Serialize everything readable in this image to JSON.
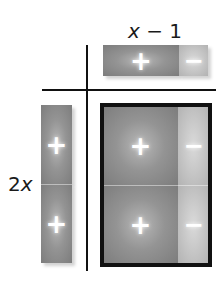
{
  "diagram": {
    "top_factor": {
      "label_var": "x",
      "label_rest": " − 1",
      "tiles": [
        {
          "type": "x",
          "sign": "+"
        },
        {
          "type": "unit",
          "sign": "−"
        }
      ]
    },
    "left_factor": {
      "label_coef": "2",
      "label_var": "x",
      "tiles": [
        {
          "type": "x",
          "sign": "+"
        },
        {
          "type": "x",
          "sign": "+"
        }
      ]
    },
    "product": {
      "rows": [
        [
          {
            "type": "x2",
            "sign": "+"
          },
          {
            "type": "x",
            "sign": "−"
          }
        ],
        [
          {
            "type": "x2",
            "sign": "+"
          },
          {
            "type": "x",
            "sign": "−"
          }
        ]
      ]
    },
    "colors": {
      "positive_tile": "#949494",
      "negative_tile": "#c6c6c6",
      "lines": "#111111",
      "sign": "#ffffff"
    }
  }
}
